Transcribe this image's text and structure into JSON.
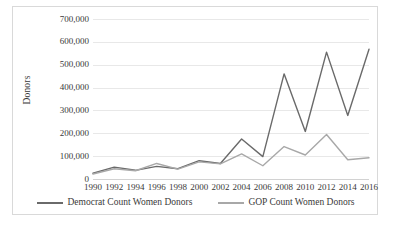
{
  "chart_data": {
    "type": "line",
    "title": "",
    "xlabel": "",
    "ylabel": "Donors",
    "x": [
      1990,
      1992,
      1994,
      1996,
      1998,
      2000,
      2002,
      2004,
      2006,
      2008,
      2010,
      2012,
      2014,
      2016
    ],
    "xtick_labels": [
      "1990",
      "1992",
      "1994",
      "1996",
      "1998",
      "2000",
      "2002",
      "2004",
      "2006",
      "2008",
      "2010",
      "2012",
      "2014",
      "2016"
    ],
    "ytick_labels": [
      "700,000",
      "600,000",
      "500,000",
      "400,000",
      "300,000",
      "200,000",
      "100,000",
      "0"
    ],
    "ytick_values": [
      700000,
      600000,
      500000,
      400000,
      300000,
      200000,
      100000,
      0
    ],
    "ylim": [
      0,
      700000
    ],
    "grid": true,
    "legend_position": "bottom",
    "series": [
      {
        "name": "Democrat Count Women Donors",
        "color": "#6a6a6a",
        "values": [
          25000,
          52000,
          38000,
          55000,
          45000,
          80000,
          68000,
          175000,
          98000,
          460000,
          208000,
          555000,
          278000,
          568000
        ]
      },
      {
        "name": "GOP Count Women Donors",
        "color": "#a8a8a8",
        "values": [
          22000,
          45000,
          36000,
          68000,
          43000,
          75000,
          66000,
          110000,
          58000,
          142000,
          105000,
          195000,
          84000,
          93000
        ]
      }
    ]
  }
}
